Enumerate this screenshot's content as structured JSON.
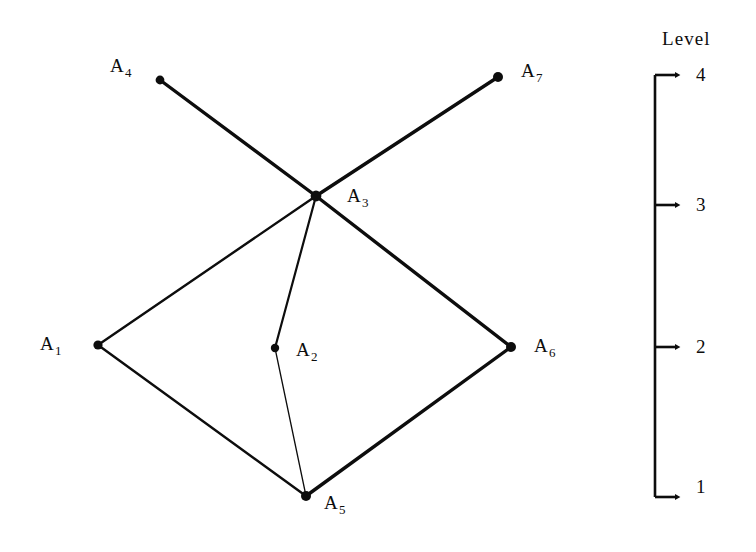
{
  "figure": {
    "background_color": "#ffffff",
    "ink_color": "#0d0d0d",
    "width": 756,
    "height": 552
  },
  "graph": {
    "nodes": [
      {
        "id": "A1",
        "label_main": "A",
        "label_sub": "1",
        "x": 98,
        "y": 345,
        "label_x": 40,
        "label_y": 334,
        "marker_r": 4.6
      },
      {
        "id": "A2",
        "label_main": "A",
        "label_sub": "2",
        "x": 275,
        "y": 348,
        "label_x": 296,
        "label_y": 340,
        "marker_r": 4.2
      },
      {
        "id": "A3",
        "label_main": "A",
        "label_sub": "3",
        "x": 316,
        "y": 196,
        "label_x": 347,
        "label_y": 186,
        "marker_r": 5.4
      },
      {
        "id": "A4",
        "label_main": "A",
        "label_sub": "4",
        "x": 160,
        "y": 80,
        "label_x": 110,
        "label_y": 56,
        "marker_r": 4.4
      },
      {
        "id": "A5",
        "label_main": "A",
        "label_sub": "5",
        "x": 306,
        "y": 496,
        "label_x": 324,
        "label_y": 493,
        "marker_r": 5.0
      },
      {
        "id": "A6",
        "label_main": "A",
        "label_sub": "6",
        "x": 511,
        "y": 347,
        "label_x": 534,
        "label_y": 336,
        "marker_r": 5.0
      },
      {
        "id": "A7",
        "label_main": "A",
        "label_sub": "7",
        "x": 498,
        "y": 77,
        "label_x": 521,
        "label_y": 61,
        "marker_r": 5.0
      }
    ],
    "edges": [
      {
        "from": "A4",
        "to": "A3",
        "width": 3.4
      },
      {
        "from": "A7",
        "to": "A3",
        "width": 3.4
      },
      {
        "from": "A3",
        "to": "A1",
        "width": 2.4
      },
      {
        "from": "A3",
        "to": "A6",
        "width": 3.4
      },
      {
        "from": "A3",
        "to": "A2",
        "width": 2.2
      },
      {
        "from": "A2",
        "to": "A5",
        "width": 1.3
      },
      {
        "from": "A1",
        "to": "A5",
        "width": 2.4
      },
      {
        "from": "A6",
        "to": "A5",
        "width": 3.4
      }
    ]
  },
  "level_axis": {
    "title": "Level",
    "title_x": 662,
    "title_y": 29,
    "spine_x": 655,
    "spine_top_y": 75,
    "spine_bottom_y": 497,
    "spine_width": 2.6,
    "tick_length": 20,
    "ticks": [
      {
        "label": "4",
        "y": 75,
        "label_x": 696,
        "label_y": 65
      },
      {
        "label": "3",
        "y": 205,
        "label_x": 696,
        "label_y": 195
      },
      {
        "label": "2",
        "y": 347,
        "label_x": 696,
        "label_y": 337
      },
      {
        "label": "1",
        "y": 497,
        "label_x": 696,
        "label_y": 477
      }
    ]
  },
  "chart_data": {
    "type": "diagram",
    "title": "",
    "subtitle": "",
    "xlabel": "",
    "ylabel": "Level",
    "ylim": [
      1,
      4
    ],
    "tick_labels": [
      "1",
      "2",
      "3",
      "4"
    ],
    "legend": [],
    "grid": false,
    "nodes": [
      "A1",
      "A2",
      "A3",
      "A4",
      "A5",
      "A6",
      "A7"
    ],
    "node_levels": {
      "A1": 2.0,
      "A2": 2.0,
      "A3": 3.1,
      "A4": 4.0,
      "A5": 1.0,
      "A6": 2.0,
      "A7": 4.0
    },
    "edges": [
      [
        "A4",
        "A3"
      ],
      [
        "A7",
        "A3"
      ],
      [
        "A3",
        "A1"
      ],
      [
        "A3",
        "A6"
      ],
      [
        "A3",
        "A2"
      ],
      [
        "A2",
        "A5"
      ],
      [
        "A1",
        "A5"
      ],
      [
        "A6",
        "A5"
      ]
    ],
    "annotations": [
      "Level",
      "1",
      "2",
      "3",
      "4",
      "A1",
      "A2",
      "A3",
      "A4",
      "A5",
      "A6",
      "A7"
    ]
  }
}
